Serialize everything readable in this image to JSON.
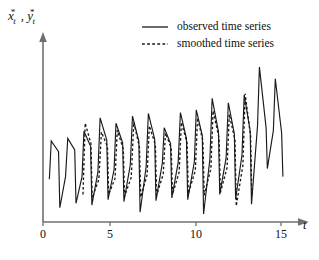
{
  "chart_data": {
    "type": "line",
    "title": "",
    "subtitle": "",
    "xlabel": "t",
    "ylabel_parts": {
      "var1": "x",
      "var1_sup": "*",
      "var1_sub": "t",
      "separator": ",",
      "var2": "y",
      "var2_sup": "*",
      "var2_sub": "t"
    },
    "ylabel": "x*t , y*t",
    "xlim": [
      0,
      15.6
    ],
    "ylim": [
      0,
      10
    ],
    "xticks": [
      0,
      5,
      10,
      15
    ],
    "xtick_labels": [
      "0",
      "5",
      "10",
      "15"
    ],
    "yticks": [],
    "ytick_labels": [],
    "grid": false,
    "legend_position": "top-center",
    "axis_style": "arrow-ended",
    "colors": {
      "axis": "#6f6f6f",
      "series": "#1a1a1a",
      "background": "#ffffff"
    },
    "legend": [
      {
        "label": "observed time series",
        "style": "solid",
        "key": "observed"
      },
      {
        "label": "smoothed time series",
        "style": "dashed",
        "key": "smoothed"
      }
    ],
    "series": [
      {
        "name": "observed time series",
        "key": "observed",
        "style": "solid",
        "points": [
          [
            0.4,
            2.4
          ],
          [
            0.52,
            4.55
          ],
          [
            0.98,
            3.95
          ],
          [
            1.06,
            0.8
          ],
          [
            1.42,
            2.55
          ],
          [
            1.56,
            4.7
          ],
          [
            2.0,
            4.05
          ],
          [
            2.08,
            1.05
          ],
          [
            2.46,
            2.55
          ],
          [
            2.58,
            5.1
          ],
          [
            3.0,
            4.25
          ],
          [
            3.08,
            0.95
          ],
          [
            3.46,
            2.8
          ],
          [
            3.6,
            5.85
          ],
          [
            4.02,
            4.6
          ],
          [
            4.1,
            1.25
          ],
          [
            4.48,
            2.95
          ],
          [
            4.6,
            5.55
          ],
          [
            5.02,
            4.45
          ],
          [
            5.1,
            1.15
          ],
          [
            5.5,
            3.2
          ],
          [
            5.64,
            5.95
          ],
          [
            6.04,
            4.55
          ],
          [
            6.12,
            0.55
          ],
          [
            6.5,
            3.1
          ],
          [
            6.64,
            6.1
          ],
          [
            7.04,
            4.65
          ],
          [
            7.12,
            1.2
          ],
          [
            7.52,
            3.3
          ],
          [
            7.64,
            5.3
          ],
          [
            8.04,
            4.4
          ],
          [
            8.12,
            1.35
          ],
          [
            8.52,
            3.35
          ],
          [
            8.66,
            6.15
          ],
          [
            9.04,
            4.7
          ],
          [
            9.12,
            1.25
          ],
          [
            9.54,
            3.4
          ],
          [
            9.66,
            6.3
          ],
          [
            10.04,
            4.85
          ],
          [
            10.12,
            0.45
          ],
          [
            10.52,
            3.55
          ],
          [
            10.66,
            6.95
          ],
          [
            11.06,
            5.05
          ],
          [
            11.14,
            1.55
          ],
          [
            11.54,
            3.6
          ],
          [
            11.68,
            6.7
          ],
          [
            12.06,
            4.95
          ],
          [
            12.14,
            1.3
          ],
          [
            12.54,
            3.75
          ],
          [
            12.68,
            7.15
          ],
          [
            13.06,
            5.1
          ],
          [
            13.14,
            1.0
          ],
          [
            13.52,
            5.4
          ],
          [
            13.64,
            8.7
          ],
          [
            14.06,
            5.3
          ],
          [
            14.14,
            3.0
          ],
          [
            14.52,
            5.15
          ],
          [
            14.64,
            8.05
          ],
          [
            15.04,
            5.0
          ],
          [
            15.12,
            2.55
          ]
        ]
      },
      {
        "name": "smoothed time series",
        "key": "smoothed",
        "style": "dashed",
        "points": [
          [
            2.52,
            1.55
          ],
          [
            2.66,
            5.55
          ],
          [
            3.02,
            4.4
          ],
          [
            3.1,
            1.35
          ],
          [
            3.52,
            2.4
          ],
          [
            3.68,
            5.05
          ],
          [
            4.06,
            4.25
          ],
          [
            4.14,
            1.55
          ],
          [
            4.54,
            2.45
          ],
          [
            4.68,
            5.15
          ],
          [
            5.06,
            4.1
          ],
          [
            5.14,
            1.45
          ],
          [
            5.56,
            2.5
          ],
          [
            5.72,
            5.6
          ],
          [
            6.08,
            4.2
          ],
          [
            6.16,
            1.4
          ],
          [
            6.56,
            2.65
          ],
          [
            6.7,
            5.4
          ],
          [
            7.08,
            4.35
          ],
          [
            7.16,
            1.5
          ],
          [
            7.58,
            2.7
          ],
          [
            7.72,
            5.0
          ],
          [
            8.08,
            4.15
          ],
          [
            8.16,
            1.55
          ],
          [
            8.58,
            2.8
          ],
          [
            8.72,
            5.6
          ],
          [
            9.08,
            4.45
          ],
          [
            9.16,
            1.6
          ],
          [
            9.6,
            2.9
          ],
          [
            9.74,
            5.85
          ],
          [
            10.08,
            4.55
          ],
          [
            10.16,
            1.5
          ],
          [
            10.58,
            3.0
          ],
          [
            10.72,
            6.25
          ],
          [
            11.1,
            4.7
          ],
          [
            11.18,
            1.65
          ],
          [
            11.6,
            3.05
          ],
          [
            11.74,
            6.05
          ],
          [
            12.1,
            4.6
          ],
          [
            12.18,
            0.9
          ],
          [
            12.6,
            3.2
          ],
          [
            12.74,
            7.2
          ],
          [
            13.08,
            4.85
          ],
          [
            13.16,
            1.45
          ]
        ]
      }
    ]
  },
  "axis": {
    "x_title": "t",
    "y_title": "x*t , y*t"
  }
}
